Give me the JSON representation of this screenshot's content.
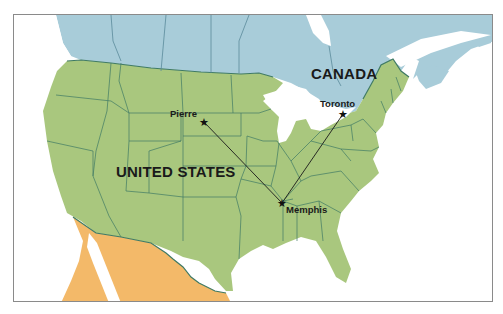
{
  "map": {
    "countries": {
      "canada": {
        "label": "CANADA",
        "color": "#a8ccd9"
      },
      "usa": {
        "label": "UNITED STATES",
        "color": "#a9c77e"
      },
      "mexico": {
        "label": "",
        "color": "#f3b969"
      }
    },
    "water_color": "#ffffff",
    "border_color": "#3f7a64",
    "cities": [
      {
        "name": "Pierre",
        "x": 203,
        "y": 121
      },
      {
        "name": "Toronto",
        "x": 342,
        "y": 113
      },
      {
        "name": "Memphis",
        "x": 281,
        "y": 202
      }
    ],
    "routes": [
      {
        "from": "Pierre",
        "to": "Memphis"
      },
      {
        "from": "Toronto",
        "to": "Memphis"
      }
    ]
  }
}
